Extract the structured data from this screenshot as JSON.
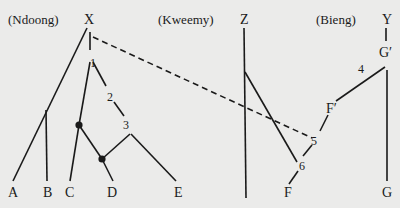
{
  "groups": {
    "ndoong": "(Ndoong)",
    "kweemy": "(Kweemy)",
    "bieng": "(Bieng)"
  },
  "nodes": {
    "X": "X",
    "Z": "Z",
    "Y": "Y",
    "G_prime": "G′",
    "F_prime": "F′",
    "A": "A",
    "B": "B",
    "C": "C",
    "D": "D",
    "E": "E",
    "F": "F",
    "G": "G"
  },
  "numbers": {
    "n1": "1",
    "n2": "2",
    "n3": "3",
    "n4": "4",
    "n5": "5",
    "n6": "6"
  },
  "colors": {
    "background": "#ebebea",
    "ink": "#1a1a1a"
  }
}
